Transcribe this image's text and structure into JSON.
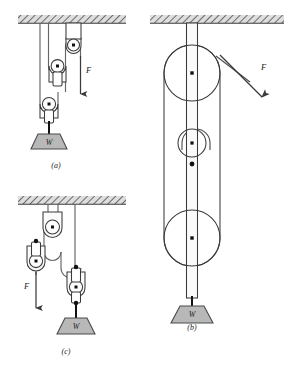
{
  "figure": {
    "background_color": "#ffffff",
    "line_color": "#3a3a3a",
    "rope_color": "#555555",
    "weight_fill": "#b8b8b8",
    "weight_stroke": "#4a4a4a",
    "ceiling_fill": "#d6d6d6",
    "hatch_color": "#555555",
    "pulley_fill": "#fbfbfb",
    "hub_color": "#111111"
  },
  "panels": [
    {
      "id": "a",
      "caption": "(a)",
      "force_label": "F",
      "weight_label": "W",
      "force_direction": "down",
      "pulley_count": 3,
      "ceiling": true
    },
    {
      "id": "b",
      "caption": "(b)",
      "force_label": "F",
      "weight_label": "W",
      "force_direction": "down-right",
      "pulley_count": 3,
      "ceiling": true
    },
    {
      "id": "c",
      "caption": "(c)",
      "force_label": "F",
      "weight_label": "W",
      "force_direction": "down",
      "pulley_count": 4,
      "ceiling": true
    }
  ]
}
